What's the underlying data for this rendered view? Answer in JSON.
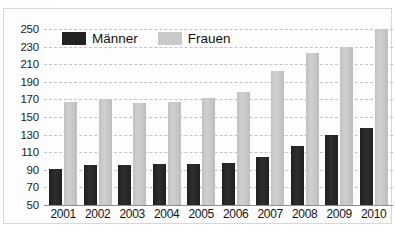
{
  "caption": {
    "sliver_text": "··························"
  },
  "legend": {
    "position": "top-left-inside",
    "items": [
      {
        "label": "Männer",
        "color": "#232323",
        "swatch": "dark-swatch"
      },
      {
        "label": "Frauen",
        "color": "#c9c9c9",
        "swatch": "light-swatch"
      }
    ]
  },
  "axes": {
    "y_ticks": [
      250,
      230,
      210,
      190,
      170,
      150,
      130,
      110,
      90,
      70,
      50
    ],
    "x_ticks": [
      "2001",
      "2002",
      "2003",
      "2004",
      "2005",
      "2006",
      "2007",
      "2008",
      "2009",
      "2010"
    ]
  },
  "colors": {
    "maenner": "#232323",
    "frauen": "#c9c9c9",
    "gridline": "#c4c4c4",
    "axis": "#8d8d8d",
    "background": "#fdfdfd",
    "frame_border": "#d8d8d8",
    "text": "#141414"
  },
  "chart_data": {
    "type": "bar",
    "title": "",
    "subtitle": "",
    "xlabel": "",
    "ylabel": "",
    "categories": [
      "2001",
      "2002",
      "2003",
      "2004",
      "2005",
      "2006",
      "2007",
      "2008",
      "2009",
      "2010"
    ],
    "series": [
      {
        "name": "Männer",
        "color": "#232323",
        "values": [
          91,
          96,
          96,
          97,
          97,
          98,
          104,
          117,
          129,
          138
        ]
      },
      {
        "name": "Frauen",
        "color": "#c9c9c9",
        "values": [
          167,
          171,
          166,
          167,
          172,
          178,
          202,
          223,
          230,
          250
        ]
      }
    ],
    "ylim": [
      50,
      250
    ],
    "ytick_step": 20,
    "grid": true,
    "grid_style": "dashed-horizontal",
    "legend_position": "top-left-inside",
    "bar_grouping": "grouped"
  }
}
